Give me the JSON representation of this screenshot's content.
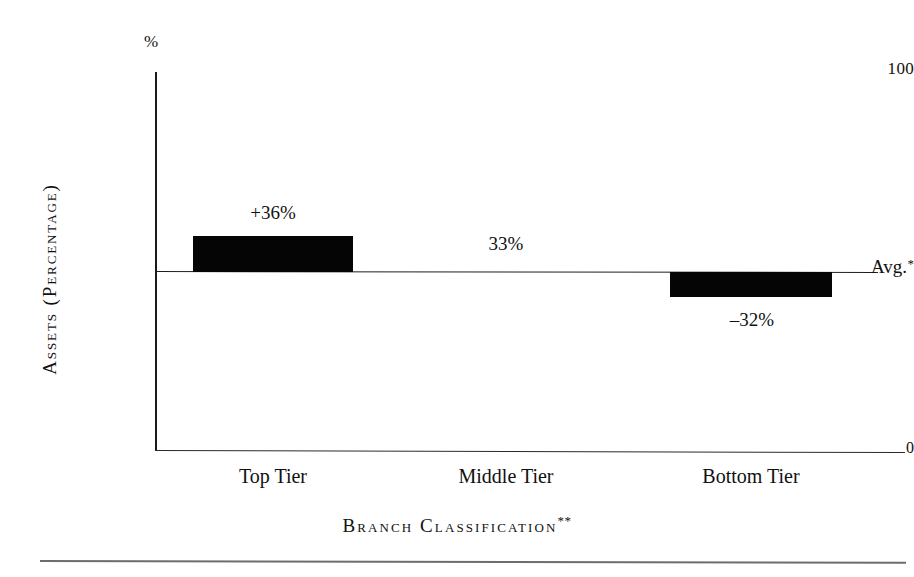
{
  "chart_data": {
    "type": "bar",
    "title": "",
    "subtitle": "",
    "categories": [
      "Top Tier",
      "Middle Tier",
      "Bottom Tier"
    ],
    "values": [
      36,
      0,
      -32
    ],
    "data_labels": [
      "+36%",
      "33%",
      "–32%"
    ],
    "xlabel": "Branch Classification",
    "xlabel_footnote": "**",
    "ylabel": "Assets (Percentage)",
    "yunit": "%",
    "ytick_labels": [
      "100",
      "Avg.",
      "0"
    ],
    "ytick_values": [
      100,
      50,
      0
    ],
    "ylim": [
      0,
      100
    ],
    "baseline_label": "Avg.",
    "baseline_footnote": "*",
    "grid": false,
    "legend": null,
    "bar_color": "#050505",
    "axis_color": "#1a1a1a",
    "background_color": "#ffffff"
  },
  "axis": {
    "percent_symbol": "%",
    "y_top_tick": "100",
    "y_avg_tick": "Avg.",
    "y_avg_star": "*",
    "y_zero_tick": "0",
    "y_title": "Assets (Percentage)",
    "x_title": "Branch Classification",
    "x_title_stars": "**"
  },
  "bars": [
    {
      "category": "Top Tier",
      "label": "+36%",
      "value": 36,
      "direction": "above"
    },
    {
      "category": "Middle Tier",
      "label": "33%",
      "value": 0,
      "direction": "at"
    },
    {
      "category": "Bottom Tier",
      "label": "–32%",
      "value": -32,
      "direction": "below"
    }
  ]
}
